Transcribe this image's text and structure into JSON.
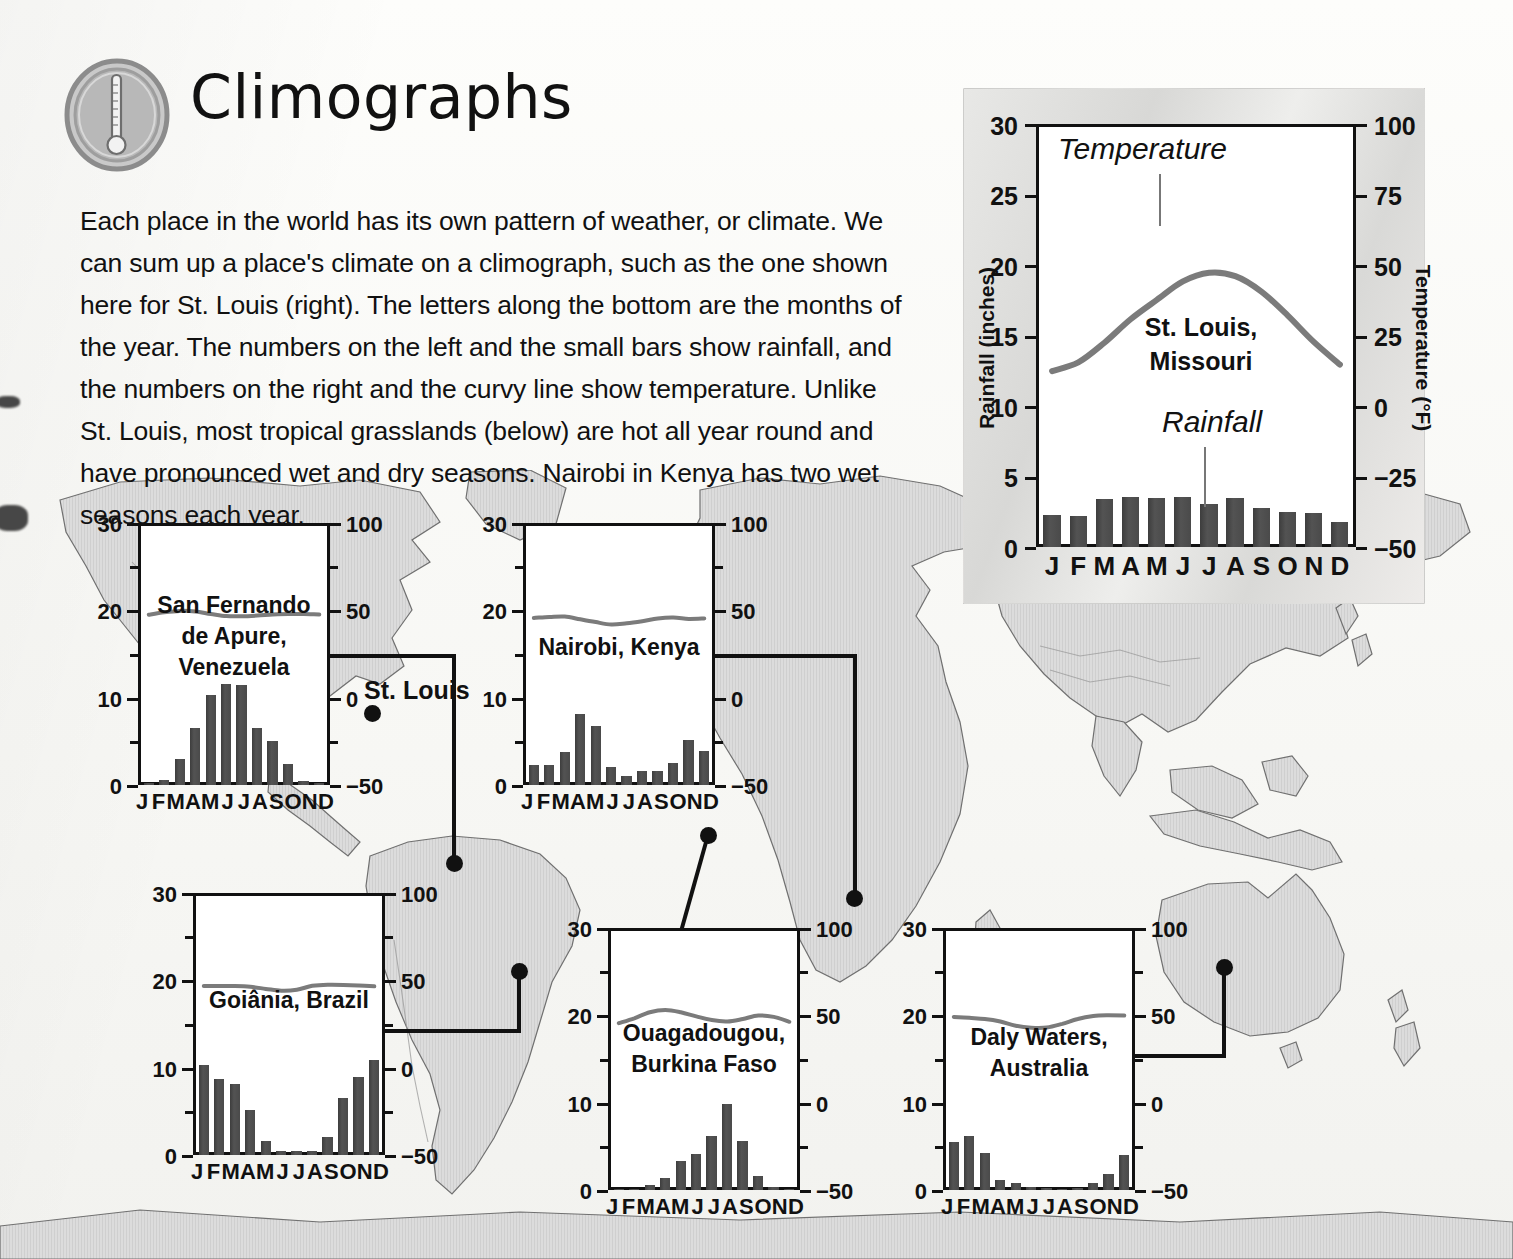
{
  "page": {
    "title": "Climographs",
    "icon": "thermometer-icon",
    "intro": "Each place in the world has its own pattern of weather, or climate. We can sum up a place's climate on a climograph, such as the one shown here for St. Louis (right). The letters along the bottom are the months of the year. The numbers on the left and the small bars show rainfall, and the numbers on the right and the curvy line show temperature. Unlike St. Louis, most tropical grasslands (below) are hot all year round and have pronounced wet and dry seasons. Nairobi in Kenya has two wet seasons each year."
  },
  "map": {
    "label": "St. Louis",
    "ocean_color": "#ffffff",
    "land_color": "#d9d9d9",
    "outline_color": "#6f6f6f"
  },
  "axes": {
    "rainfall_title": "Rainfall (inches)",
    "temperature_title": "Temperature (°F)",
    "rain_ticks": [
      "30",
      "25",
      "20",
      "15",
      "10",
      "5",
      "0"
    ],
    "rain_ticks_small": [
      "30",
      "20",
      "10",
      "0"
    ],
    "temp_ticks": [
      "100",
      "75",
      "50",
      "25",
      "0",
      "−25",
      "−50"
    ],
    "temp_ticks_small": [
      "100",
      "50",
      "0",
      "−50"
    ],
    "months": [
      "J",
      "F",
      "M",
      "A",
      "M",
      "J",
      "J",
      "A",
      "S",
      "O",
      "N",
      "D"
    ]
  },
  "annotations": {
    "temperature": "Temperature",
    "rainfall": "Rainfall"
  },
  "chart_data": [
    {
      "type": "bar",
      "id": "st-louis",
      "title": "St. Louis,\nMissouri",
      "categories": [
        "J",
        "F",
        "M",
        "A",
        "M",
        "J",
        "J",
        "A",
        "S",
        "O",
        "N",
        "D"
      ],
      "xlabel": "",
      "ylabel": "Rainfall (inches)",
      "y2label": "Temperature (°F)",
      "ylim": [
        0,
        30
      ],
      "y2lim": [
        -50,
        100
      ],
      "grid": false,
      "legend": "none",
      "series": [
        {
          "name": "Rainfall",
          "unit": "inches",
          "type": "bar",
          "values": [
            2.3,
            2.2,
            3.4,
            3.6,
            3.5,
            3.6,
            3.1,
            3.5,
            2.8,
            2.5,
            2.4,
            1.8
          ]
        },
        {
          "name": "Temperature",
          "unit": "°C",
          "type": "line",
          "values": [
            0.5,
            2.8,
            8.0,
            14.2,
            19.3,
            24.2,
            26.5,
            25.6,
            21.5,
            15.2,
            8.2,
            2.2
          ]
        }
      ]
    },
    {
      "type": "bar",
      "id": "san-fernando",
      "title": "San Fernando\nde Apure,\nVenezuela",
      "categories": [
        "J",
        "F",
        "M",
        "A",
        "M",
        "J",
        "J",
        "A",
        "S",
        "O",
        "N",
        "D"
      ],
      "ylim": [
        0,
        30
      ],
      "y2lim": [
        -50,
        100
      ],
      "grid": false,
      "legend": "none",
      "series": [
        {
          "name": "Rainfall",
          "unit": "inches",
          "type": "bar",
          "values": [
            0.2,
            0.6,
            3.0,
            6.6,
            10.4,
            11.7,
            11.6,
            6.6,
            5.1,
            2.4,
            0.5,
            0.2
          ]
        },
        {
          "name": "Temperature",
          "unit": "°C",
          "type": "line",
          "values": [
            27.0,
            28.0,
            28.6,
            28.4,
            27.3,
            26.4,
            26.3,
            26.6,
            27.1,
            27.3,
            27.3,
            27.1
          ]
        }
      ]
    },
    {
      "type": "bar",
      "id": "nairobi",
      "title": "Nairobi, Kenya",
      "categories": [
        "J",
        "F",
        "M",
        "A",
        "M",
        "J",
        "J",
        "A",
        "S",
        "O",
        "N",
        "D"
      ],
      "ylim": [
        0,
        30
      ],
      "y2lim": [
        -50,
        100
      ],
      "grid": false,
      "legend": "none",
      "series": [
        {
          "name": "Rainfall",
          "unit": "inches",
          "type": "bar",
          "values": [
            2.3,
            2.3,
            3.8,
            8.2,
            6.8,
            2.1,
            1.0,
            1.6,
            1.6,
            2.6,
            5.2,
            3.9
          ]
        },
        {
          "name": "Temperature",
          "unit": "°C",
          "type": "line",
          "values": [
            25.6,
            26.0,
            26.2,
            25.0,
            23.8,
            22.8,
            23.3,
            24.2,
            25.4,
            25.8,
            25.2,
            25.4
          ]
        }
      ]
    },
    {
      "type": "bar",
      "id": "goiania",
      "title": "Goiânia, Brazil",
      "categories": [
        "J",
        "F",
        "M",
        "A",
        "M",
        "J",
        "J",
        "A",
        "S",
        "O",
        "N",
        "D"
      ],
      "ylim": [
        0,
        30
      ],
      "y2lim": [
        -50,
        100
      ],
      "grid": false,
      "legend": "none",
      "series": [
        {
          "name": "Rainfall",
          "unit": "inches",
          "type": "bar",
          "values": [
            10.4,
            8.8,
            8.2,
            5.2,
            1.6,
            0.5,
            0.5,
            0.5,
            2.1,
            6.6,
            9.0,
            11.0
          ]
        },
        {
          "name": "Temperature",
          "unit": "°C",
          "type": "line",
          "values": [
            26.4,
            26.4,
            26.4,
            26.1,
            25.2,
            24.4,
            24.8,
            26.5,
            27.0,
            26.9,
            26.6,
            26.3
          ]
        }
      ]
    },
    {
      "type": "bar",
      "id": "ouagadougou",
      "title": "Ouagadougou,\nBurkina Faso",
      "categories": [
        "J",
        "F",
        "M",
        "A",
        "M",
        "J",
        "J",
        "A",
        "S",
        "O",
        "N",
        "D"
      ],
      "ylim": [
        0,
        30
      ],
      "y2lim": [
        -50,
        100
      ],
      "grid": false,
      "legend": "none",
      "series": [
        {
          "name": "Rainfall",
          "unit": "inches",
          "type": "bar",
          "values": [
            0.05,
            0.1,
            0.6,
            1.4,
            3.4,
            4.2,
            6.3,
            10.0,
            5.7,
            1.6,
            0.3,
            0.05
          ]
        },
        {
          "name": "Temperature",
          "unit": "°C",
          "type": "line",
          "values": [
            25.5,
            27.6,
            30.2,
            31.2,
            30.2,
            28.4,
            26.8,
            26.2,
            27.3,
            28.8,
            28.2,
            26.1
          ]
        }
      ]
    },
    {
      "type": "bar",
      "id": "daly-waters",
      "title": "Daly Waters,\nAustralia",
      "categories": [
        "J",
        "F",
        "M",
        "A",
        "M",
        "J",
        "J",
        "A",
        "S",
        "O",
        "N",
        "D"
      ],
      "ylim": [
        0,
        30
      ],
      "y2lim": [
        -50,
        100
      ],
      "grid": false,
      "legend": "none",
      "series": [
        {
          "name": "Rainfall",
          "unit": "inches",
          "type": "bar",
          "values": [
            5.6,
            6.3,
            4.3,
            1.2,
            0.8,
            0.3,
            0.2,
            0.1,
            0.2,
            0.8,
            1.8,
            4.0
          ]
        },
        {
          "name": "Temperature",
          "unit": "°C",
          "type": "line",
          "values": [
            28.2,
            27.8,
            27.3,
            26.2,
            24.4,
            23.5,
            23.6,
            25.2,
            27.3,
            28.6,
            28.9,
            28.8
          ]
        }
      ]
    }
  ]
}
